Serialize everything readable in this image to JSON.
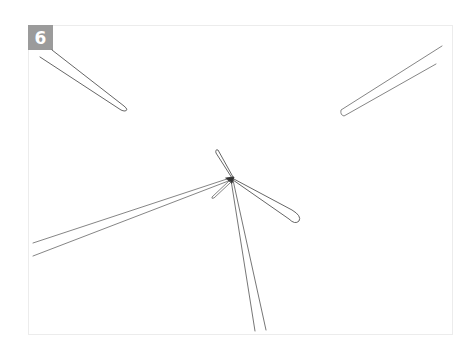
{
  "figure": {
    "step_number": "6",
    "badge_color": "#9b9b9b",
    "line_color": "#444444"
  }
}
